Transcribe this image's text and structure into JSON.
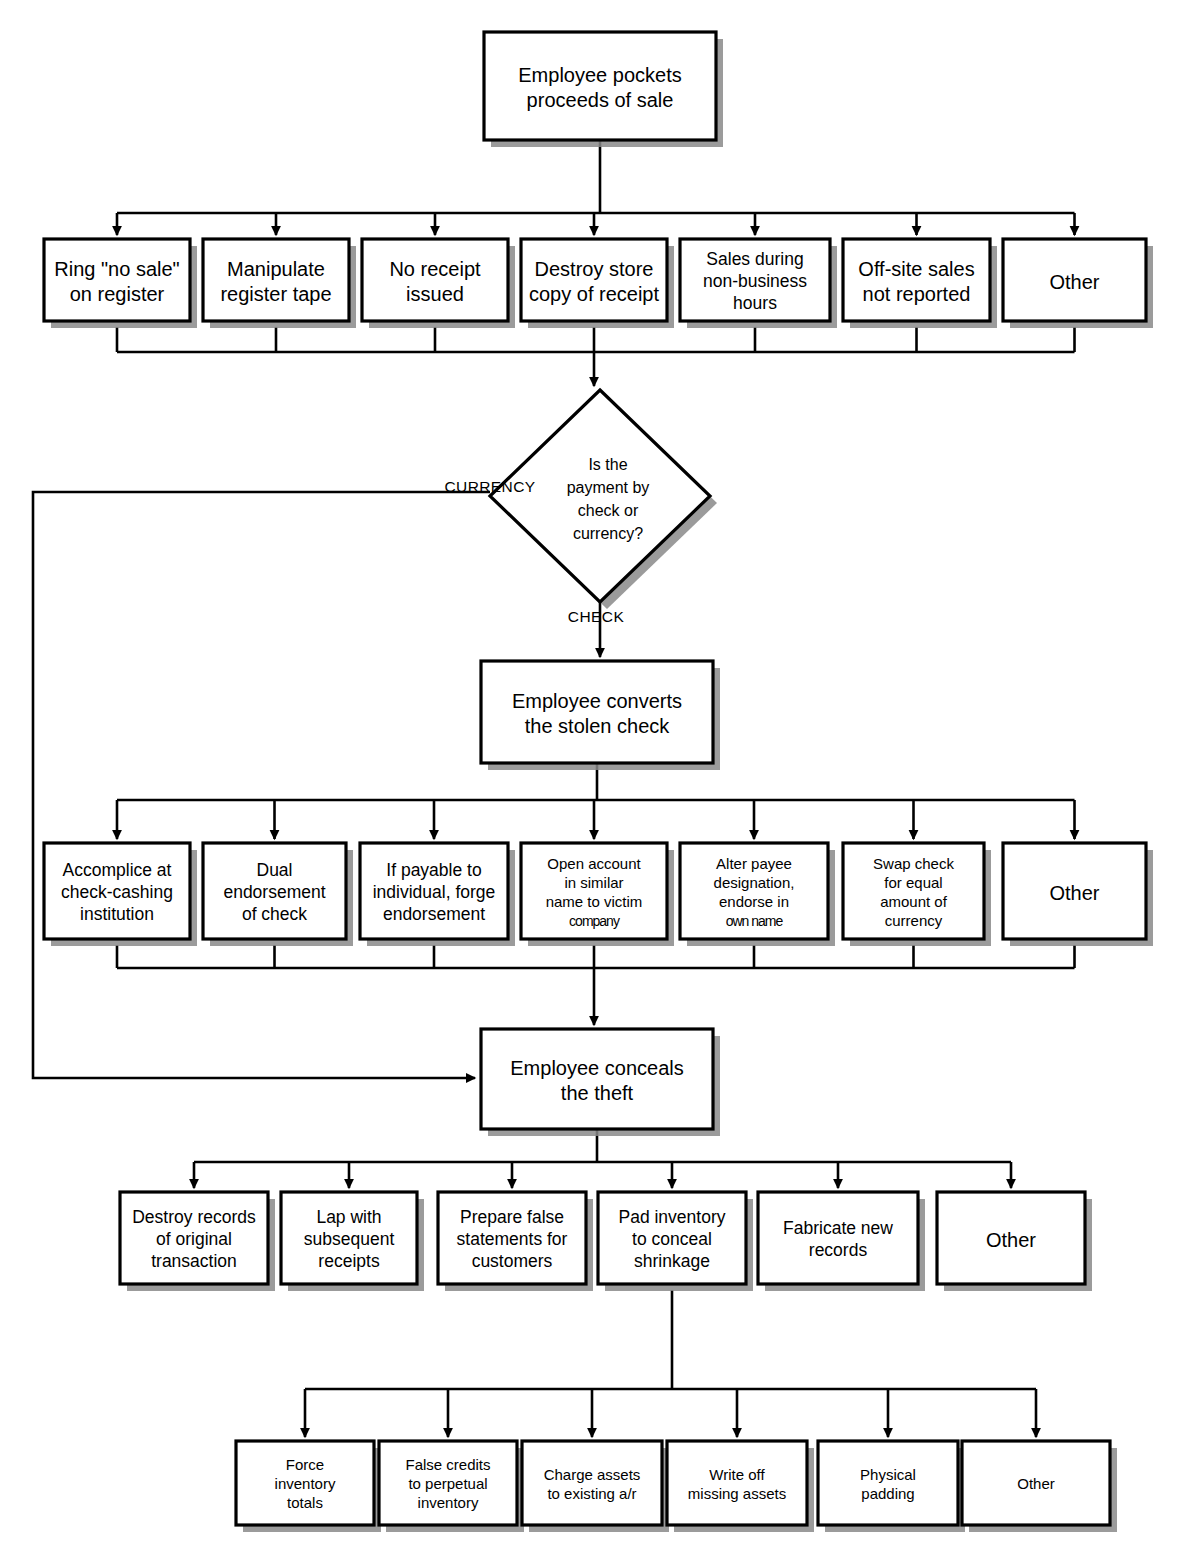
{
  "diagram": {
    "type": "flowchart",
    "nodes": {
      "root": {
        "label_line1": "Employee pockets",
        "label_line2": "proceeds of sale"
      },
      "decision": {
        "line1": "Is the",
        "line2": "payment by",
        "line3": "check or",
        "line4": "currency?"
      },
      "convert": {
        "line1": "Employee converts",
        "line2": "the stolen check"
      },
      "conceal": {
        "line1": "Employee conceals",
        "line2": "the theft"
      }
    },
    "edge_labels": {
      "currency": "CURRENCY",
      "check": "CHECK"
    },
    "row_skimming": [
      {
        "lines": [
          "Ring \"no sale\"",
          "on register"
        ]
      },
      {
        "lines": [
          "Manipulate",
          "register tape"
        ]
      },
      {
        "lines": [
          "No receipt",
          "issued"
        ]
      },
      {
        "lines": [
          "Destroy store",
          "copy of receipt"
        ]
      },
      {
        "lines": [
          "Sales during",
          "non-business",
          "hours"
        ]
      },
      {
        "lines": [
          "Off-site sales",
          "not reported"
        ]
      },
      {
        "lines": [
          "Other"
        ]
      }
    ],
    "row_conversion": [
      {
        "lines": [
          "Accomplice at",
          "check-cashing",
          "institution"
        ]
      },
      {
        "lines": [
          "Dual",
          "endorsement",
          "of check"
        ]
      },
      {
        "lines": [
          "If payable to",
          "individual, forge",
          "endorsement"
        ]
      },
      {
        "lines": [
          "Open account",
          "in similar",
          "name to victim",
          "company"
        ]
      },
      {
        "lines": [
          "Alter payee",
          "designation,",
          "endorse in",
          "own name"
        ]
      },
      {
        "lines": [
          "Swap check",
          "for equal",
          "amount of",
          "currency"
        ]
      },
      {
        "lines": [
          "Other"
        ]
      }
    ],
    "row_concealment": [
      {
        "lines": [
          "Destroy records",
          "of original",
          "transaction"
        ]
      },
      {
        "lines": [
          "Lap with",
          "subsequent",
          "receipts"
        ]
      },
      {
        "lines": [
          "Prepare false",
          "statements for",
          "customers"
        ]
      },
      {
        "lines": [
          "Pad inventory",
          "to conceal",
          "shrinkage"
        ]
      },
      {
        "lines": [
          "Fabricate new",
          "records"
        ]
      },
      {
        "lines": [
          "Other"
        ]
      }
    ],
    "row_padding": [
      {
        "lines": [
          "Force",
          "inventory",
          "totals"
        ]
      },
      {
        "lines": [
          "False credits",
          "to perpetual",
          "inventory"
        ]
      },
      {
        "lines": [
          "Charge assets",
          "to existing a/r"
        ]
      },
      {
        "lines": [
          "Write off",
          "missing assets"
        ]
      },
      {
        "lines": [
          "Physical",
          "padding"
        ]
      },
      {
        "lines": [
          "Other"
        ]
      }
    ],
    "colors": {
      "stroke": "#000000",
      "fill": "#ffffff",
      "shadow": "#8a8a8a"
    }
  }
}
